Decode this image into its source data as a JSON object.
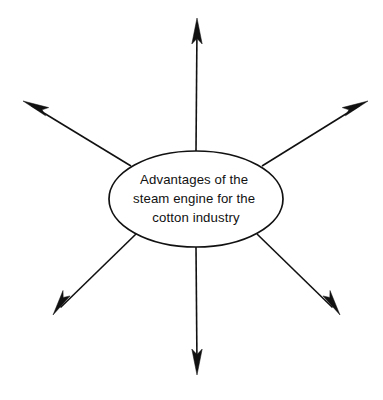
{
  "canvas": {
    "width": 383,
    "height": 400,
    "background_color": "#ffffff",
    "stroke_color": "#111111"
  },
  "diagram": {
    "type": "spider-diagram",
    "center_node": {
      "label_lines": [
        "Advantages of the",
        "steam engine for the",
        "cotton industry"
      ],
      "full_label": "Advantages of the steam engine for the cotton industry",
      "shape": "ellipse",
      "center_x": 196,
      "center_y": 199,
      "radius_x": 87,
      "radius_y": 48,
      "fill_color": "#ffffff",
      "border_color": "#111111"
    },
    "spokes": [
      {
        "name": "spoke-up",
        "direction": "up",
        "start_x": 196,
        "start_y": 151,
        "tip_x": 197,
        "tip_y": 18,
        "label": ""
      },
      {
        "name": "spoke-upper-left",
        "direction": "upper-left",
        "start_x": 131,
        "start_y": 166,
        "tip_x": 23,
        "tip_y": 101,
        "label": ""
      },
      {
        "name": "spoke-upper-right",
        "direction": "upper-right",
        "start_x": 262,
        "start_y": 166,
        "tip_x": 368,
        "tip_y": 101,
        "label": ""
      },
      {
        "name": "spoke-lower-left",
        "direction": "lower-left",
        "start_x": 136,
        "start_y": 234,
        "tip_x": 53,
        "tip_y": 315,
        "label": ""
      },
      {
        "name": "spoke-lower-right",
        "direction": "lower-right",
        "start_x": 257,
        "start_y": 234,
        "tip_x": 340,
        "tip_y": 315,
        "label": ""
      },
      {
        "name": "spoke-down",
        "direction": "down",
        "start_x": 196,
        "start_y": 247,
        "tip_x": 197,
        "tip_y": 375,
        "label": ""
      }
    ]
  }
}
